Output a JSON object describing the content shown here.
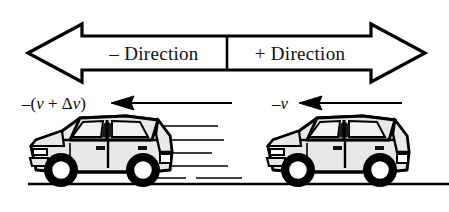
{
  "figure": {
    "background_color": "#ffffff",
    "ink_color": "#000000",
    "car_body_color": "#e8e8e8",
    "car_window_color": "#f2f2f2",
    "car_outline_color": "#000000"
  },
  "banner": {
    "name": "direction-axis-arrow",
    "style": "double-headed-block-arrow",
    "left_label": "– Direction",
    "right_label": "+ Direction",
    "divider_x": 227,
    "left_tip_x": 28,
    "right_tip_x": 425
  },
  "vectors": [
    {
      "id": "left-velocity",
      "label": "–(v + Δv)",
      "label_parts": {
        "minus": "–(",
        "v1": "v",
        "plus": " + ",
        "delta": "Δ",
        "v2": "v",
        "close": ")"
      },
      "arrow_direction": "left",
      "shaft_start_x": 232,
      "shaft_end_x": 113,
      "y": 103
    },
    {
      "id": "right-velocity",
      "label": "–v",
      "label_parts": {
        "minus": "–",
        "v1": "v"
      },
      "arrow_direction": "left",
      "shaft_start_x": 402,
      "shaft_end_x": 300,
      "y": 103
    }
  ],
  "cars": [
    {
      "id": "rear-car",
      "position": "left",
      "facing": "left",
      "velocity_label": "–(v + Δv)",
      "has_speed_lines": true,
      "speed_line_count": 6
    },
    {
      "id": "front-car",
      "position": "right",
      "facing": "left",
      "velocity_label": "–v",
      "has_speed_lines": false,
      "speed_line_count": 0
    }
  ],
  "ground": {
    "name": "ground-line",
    "y": 184,
    "x_start": 28,
    "x_end": 449
  }
}
